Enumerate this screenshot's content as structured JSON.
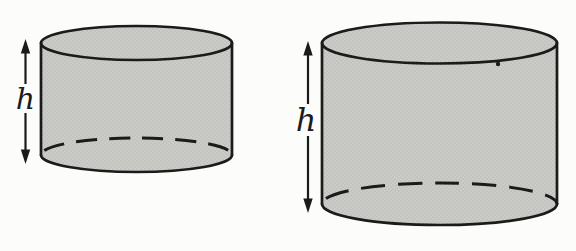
{
  "figure": {
    "cylinders": [
      {
        "id": "small-cylinder",
        "height_label": "h"
      },
      {
        "id": "large-cylinder",
        "height_label": "h"
      }
    ]
  },
  "colors": {
    "background": "#fcfcfa",
    "cylinder_fill": "#cbcbc8",
    "halftone_dot": "#bcbcb9",
    "line": "#1b1b1b"
  }
}
